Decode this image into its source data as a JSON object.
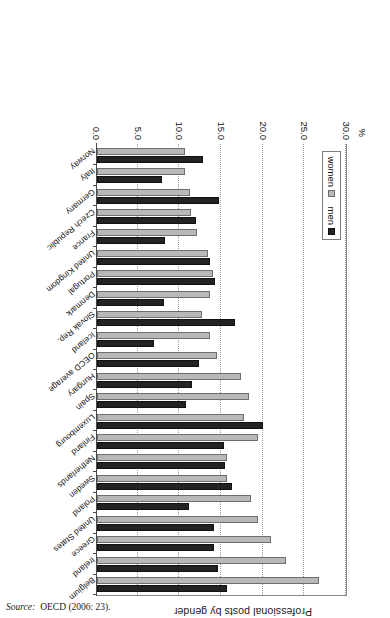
{
  "figure": {
    "title": "Professional posts by gender",
    "unit_label": "%",
    "source_label": "Source:",
    "source_value": "OECD (2006: 23)."
  },
  "legend": {
    "position": "inside-left",
    "items": [
      {
        "label": "women",
        "color": "#b8b8b8"
      },
      {
        "label": "men",
        "color": "#232323"
      }
    ]
  },
  "chart_data": {
    "type": "bar",
    "orientation": "horizontal",
    "title": "Professional posts by gender",
    "xlabel": "%",
    "ylabel": "",
    "xlim": [
      0.0,
      30.0
    ],
    "xticks": [
      "0.0",
      "5.0",
      "10.0",
      "15.0",
      "20.0",
      "25.0",
      "30.0"
    ],
    "xtick_values": [
      0.0,
      5.0,
      10.0,
      15.0,
      20.0,
      25.0,
      30.0
    ],
    "grid": true,
    "grid_axis": "x",
    "legend_position": "inside left",
    "rotated_180": true,
    "categories": [
      "Norway",
      "Italy",
      "Germany",
      "Czech Republic",
      "France",
      "United Kingdom",
      "Portugal",
      "Denmark",
      "Slovak Rep.",
      "Iceland",
      "OECD average",
      "Hungary",
      "Spain",
      "Luxembourg",
      "Finland",
      "Netherlands",
      "Sweden",
      "Poland",
      "United States",
      "Greece",
      "Ireland",
      "Belgium"
    ],
    "series": [
      {
        "name": "women",
        "color": "#b8b8b8",
        "values": [
          10.6,
          10.6,
          11.2,
          11.3,
          12.0,
          13.3,
          13.9,
          13.6,
          12.6,
          13.6,
          14.4,
          17.3,
          18.2,
          17.7,
          19.3,
          15.6,
          15.6,
          18.5,
          19.3,
          20.9,
          22.7,
          26.6
        ]
      },
      {
        "name": "men",
        "color": "#232323",
        "values": [
          12.7,
          7.8,
          14.7,
          11.9,
          8.2,
          13.6,
          14.2,
          8.0,
          16.6,
          6.8,
          12.3,
          11.4,
          10.7,
          19.9,
          15.3,
          15.4,
          16.2,
          11.0,
          14.0,
          14.0,
          14.5,
          15.6
        ]
      }
    ]
  }
}
